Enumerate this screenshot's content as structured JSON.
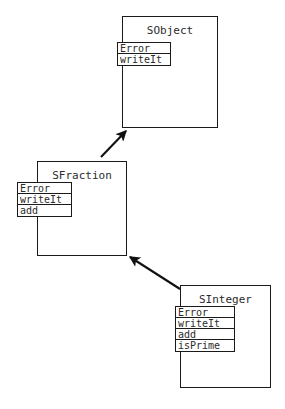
{
  "diagram": {
    "type": "uml-class-inheritance",
    "background_color": "#ffffff",
    "line_color": "#1a1a1a",
    "text_color": "#2b2b2b",
    "classes": [
      {
        "id": "sobject",
        "name": "SObject",
        "box": {
          "x": 122,
          "y": 16,
          "width": 96,
          "height": 112
        },
        "method_box": {
          "x": 117,
          "y": 42,
          "width": 54,
          "height": 24
        },
        "methods": [
          "Error",
          "writeIt"
        ]
      },
      {
        "id": "sfraction",
        "name": "SFraction",
        "box": {
          "x": 37,
          "y": 161,
          "width": 90,
          "height": 95
        },
        "method_box": {
          "x": 17,
          "y": 182,
          "width": 55,
          "height": 35
        },
        "methods": [
          "Error",
          "writeIt",
          "add"
        ]
      },
      {
        "id": "sinteger",
        "name": "SInteger",
        "box": {
          "x": 180,
          "y": 285,
          "width": 91,
          "height": 103
        },
        "method_box": {
          "x": 175,
          "y": 306,
          "width": 60,
          "height": 46
        },
        "methods": [
          "Error",
          "writeIt",
          "add",
          "isPrime"
        ]
      }
    ],
    "arrows": [
      {
        "id": "sfraction-to-sobject",
        "from": "sfraction",
        "to": "sobject",
        "label": "inherits",
        "x1": 101,
        "y1": 157,
        "x2": 126,
        "y2": 131
      },
      {
        "id": "sinteger-to-sfraction",
        "from": "sinteger",
        "to": "sfraction",
        "label": "inherits",
        "x1": 180,
        "y1": 289,
        "x2": 130,
        "y2": 257
      }
    ]
  }
}
